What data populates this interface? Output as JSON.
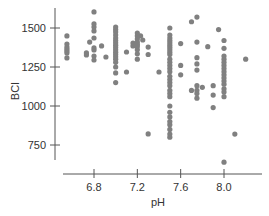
{
  "chart_data": {
    "type": "scatter",
    "title": "",
    "xlabel": "pH",
    "ylabel": "BCI",
    "xlim": [
      6.4,
      8.3
    ],
    "ylim": [
      650,
      1620
    ],
    "x_ticks": [
      6.8,
      7.2,
      7.6,
      8.0
    ],
    "x_tick_labels": [
      "6.8",
      "7.2",
      "7.6",
      "8.0"
    ],
    "y_ticks": [
      750,
      1000,
      1250,
      1500
    ],
    "y_tick_labels": [
      "750",
      "1000",
      "1250",
      "1500"
    ],
    "grid": false,
    "legend": null,
    "point_color": "#808080",
    "points": [
      [
        6.55,
        1449
      ],
      [
        6.55,
        1397
      ],
      [
        6.55,
        1378
      ],
      [
        6.55,
        1365
      ],
      [
        6.55,
        1353
      ],
      [
        6.55,
        1340
      ],
      [
        6.55,
        1308
      ],
      [
        6.73,
        1340
      ],
      [
        6.73,
        1327
      ],
      [
        6.76,
        1410
      ],
      [
        6.8,
        1603
      ],
      [
        6.8,
        1526
      ],
      [
        6.8,
        1506
      ],
      [
        6.8,
        1481
      ],
      [
        6.8,
        1436
      ],
      [
        6.8,
        1372
      ],
      [
        6.8,
        1359
      ],
      [
        6.8,
        1320
      ],
      [
        6.8,
        1295
      ],
      [
        6.87,
        1385
      ],
      [
        6.91,
        1314
      ],
      [
        7.0,
        1506
      ],
      [
        7.0,
        1490
      ],
      [
        7.0,
        1475
      ],
      [
        7.0,
        1455
      ],
      [
        7.0,
        1436
      ],
      [
        7.0,
        1420
      ],
      [
        7.0,
        1405
      ],
      [
        7.0,
        1390
      ],
      [
        7.0,
        1375
      ],
      [
        7.0,
        1360
      ],
      [
        7.0,
        1345
      ],
      [
        7.0,
        1330
      ],
      [
        7.0,
        1315
      ],
      [
        7.0,
        1300
      ],
      [
        7.0,
        1280
      ],
      [
        7.0,
        1250
      ],
      [
        7.0,
        1212
      ],
      [
        7.0,
        1150
      ],
      [
        7.1,
        1346
      ],
      [
        7.1,
        1218
      ],
      [
        7.16,
        1404
      ],
      [
        7.16,
        1385
      ],
      [
        7.2,
        1468
      ],
      [
        7.2,
        1450
      ],
      [
        7.2,
        1430
      ],
      [
        7.2,
        1410
      ],
      [
        7.2,
        1395
      ],
      [
        7.2,
        1380
      ],
      [
        7.2,
        1360
      ],
      [
        7.2,
        1335
      ],
      [
        7.2,
        1300
      ],
      [
        7.23,
        1449
      ],
      [
        7.25,
        1423
      ],
      [
        7.3,
        1378
      ],
      [
        7.3,
        1330
      ],
      [
        7.3,
        821
      ],
      [
        7.4,
        1218
      ],
      [
        7.5,
        1500
      ],
      [
        7.5,
        1455
      ],
      [
        7.5,
        1436
      ],
      [
        7.5,
        1420
      ],
      [
        7.5,
        1405
      ],
      [
        7.5,
        1390
      ],
      [
        7.5,
        1375
      ],
      [
        7.5,
        1360
      ],
      [
        7.5,
        1345
      ],
      [
        7.5,
        1330
      ],
      [
        7.5,
        1300
      ],
      [
        7.5,
        1280
      ],
      [
        7.5,
        1260
      ],
      [
        7.5,
        1240
      ],
      [
        7.5,
        1220
      ],
      [
        7.5,
        1190
      ],
      [
        7.5,
        1170
      ],
      [
        7.5,
        1150
      ],
      [
        7.5,
        1130
      ],
      [
        7.5,
        1100
      ],
      [
        7.5,
        1080
      ],
      [
        7.5,
        1060
      ],
      [
        7.5,
        1000
      ],
      [
        7.5,
        960
      ],
      [
        7.5,
        930
      ],
      [
        7.5,
        900
      ],
      [
        7.5,
        880
      ],
      [
        7.5,
        850
      ],
      [
        7.5,
        820
      ],
      [
        7.5,
        800
      ],
      [
        7.6,
        1400
      ],
      [
        7.6,
        1260
      ],
      [
        7.6,
        1200
      ],
      [
        7.7,
        1540
      ],
      [
        7.7,
        1100
      ],
      [
        7.75,
        1570
      ],
      [
        7.75,
        1410
      ],
      [
        7.75,
        1310
      ],
      [
        7.75,
        1270
      ],
      [
        7.75,
        1230
      ],
      [
        7.75,
        1130
      ],
      [
        7.75,
        1100
      ],
      [
        7.75,
        1080
      ],
      [
        7.75,
        1050
      ],
      [
        7.8,
        1120
      ],
      [
        7.85,
        1380
      ],
      [
        7.9,
        1130
      ],
      [
        7.9,
        1070
      ],
      [
        7.9,
        990
      ],
      [
        7.95,
        1490
      ],
      [
        8.0,
        1420
      ],
      [
        8.0,
        1370
      ],
      [
        8.0,
        1320
      ],
      [
        8.0,
        1300
      ],
      [
        8.0,
        1280
      ],
      [
        8.0,
        1260
      ],
      [
        8.0,
        1240
      ],
      [
        8.0,
        1220
      ],
      [
        8.0,
        1200
      ],
      [
        8.0,
        1180
      ],
      [
        8.0,
        1160
      ],
      [
        8.0,
        1140
      ],
      [
        8.0,
        1110
      ],
      [
        8.0,
        1090
      ],
      [
        8.0,
        1060
      ],
      [
        8.0,
        640
      ],
      [
        8.1,
        820
      ],
      [
        8.2,
        1300
      ]
    ]
  }
}
